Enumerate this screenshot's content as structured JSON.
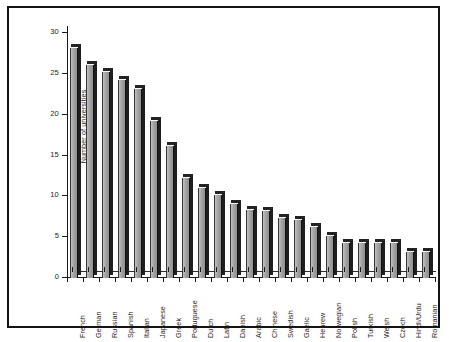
{
  "chart_data": {
    "type": "bar",
    "title": "",
    "xlabel": "",
    "ylabel": "Number of universities",
    "ylim": [
      0,
      30
    ],
    "yticks": [
      0,
      5,
      10,
      15,
      20,
      25,
      30
    ],
    "grid": false,
    "legend": null,
    "style": "3d-shaded-vertical-bars",
    "bar_color": "#a6a6a6",
    "edge_color": "#1e1e1e",
    "categories": [
      "French",
      "German",
      "Russian",
      "Spanish",
      "Italian",
      "Japanese",
      "Greek",
      "Portuguese",
      "Dutch",
      "Latin",
      "Danish",
      "Arabic",
      "Chinese",
      "Swedish",
      "Gaelic",
      "Hebrew",
      "Norwegian",
      "Polish",
      "Turkish",
      "Welsh",
      "Czech",
      "Hindi/Urdu",
      "Romanian"
    ],
    "values": [
      28.2,
      26.1,
      25.2,
      24.2,
      23.2,
      19.2,
      16.2,
      12.2,
      11.0,
      10.2,
      9.1,
      8.3,
      8.2,
      7.3,
      7.1,
      6.2,
      5.2,
      4.3,
      4.3,
      4.3,
      4.3,
      3.2,
      3.2
    ]
  },
  "figure": {
    "frame_color": "#141414",
    "background": "#ffffff"
  }
}
